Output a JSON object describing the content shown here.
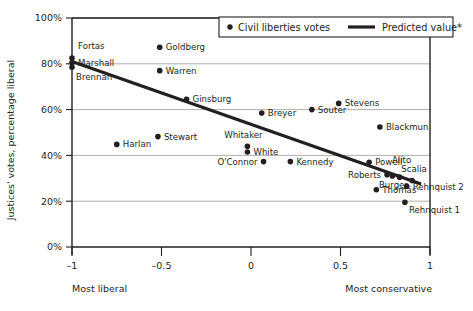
{
  "chart_data": {
    "type": "scatter",
    "title": "",
    "xlabel": "",
    "ylabel": "Justices' votes, percentage liberal",
    "xlim": [
      -1.08,
      1.08
    ],
    "ylim": [
      0,
      100
    ],
    "grid": true,
    "legend_position": "top-right",
    "x_axis_left_note": "Most liberal",
    "x_axis_right_note": "Most conservative",
    "xticks": [
      "–1",
      "–0.5",
      "0",
      "0.5",
      "1"
    ],
    "xtick_values": [
      -1,
      -0.5,
      0,
      0.5,
      1
    ],
    "yticks": [
      "0%",
      "20%",
      "40%",
      "60%",
      "80%",
      "100%"
    ],
    "ytick_values": [
      0,
      20,
      40,
      60,
      80,
      100
    ],
    "series": [
      {
        "name": "Civil liberties votes",
        "type": "scatter",
        "points": [
          {
            "label": "Fortas",
            "x": -1.0,
            "y": 82.5,
            "label_dx": 6,
            "label_dy": -9,
            "anchor": "start"
          },
          {
            "label": "Marshall",
            "x": -1.0,
            "y": 80.5,
            "label_dx": 6,
            "label_dy": 3,
            "anchor": "start"
          },
          {
            "label": "Brennan",
            "x": -1.0,
            "y": 78.5,
            "label_dx": 4,
            "label_dy": 13,
            "anchor": "start"
          },
          {
            "label": "Goldberg",
            "x": -0.51,
            "y": 87.2,
            "label_dx": 6,
            "label_dy": 3,
            "anchor": "start"
          },
          {
            "label": "Warren",
            "x": -0.51,
            "y": 77.0,
            "label_dx": 6,
            "label_dy": 3,
            "anchor": "start"
          },
          {
            "label": "Ginsburg",
            "x": -0.36,
            "y": 64.5,
            "label_dx": 6,
            "label_dy": 3,
            "anchor": "start"
          },
          {
            "label": "Harlan",
            "x": -0.75,
            "y": 44.8,
            "label_dx": 6,
            "label_dy": 3,
            "anchor": "start"
          },
          {
            "label": "Stewart",
            "x": -0.52,
            "y": 48.2,
            "label_dx": 6,
            "label_dy": 3,
            "anchor": "start"
          },
          {
            "label": "Breyer",
            "x": 0.06,
            "y": 58.5,
            "label_dx": 6,
            "label_dy": 3,
            "anchor": "start"
          },
          {
            "label": "Souter",
            "x": 0.34,
            "y": 60.0,
            "label_dx": 6,
            "label_dy": 3,
            "anchor": "start"
          },
          {
            "label": "Stevens",
            "x": 0.49,
            "y": 62.7,
            "label_dx": 6,
            "label_dy": 3,
            "anchor": "start"
          },
          {
            "label": "Blackmun",
            "x": 0.72,
            "y": 52.4,
            "label_dx": 6,
            "label_dy": 3,
            "anchor": "start"
          },
          {
            "label": "Whitaker",
            "x": -0.02,
            "y": 44.0,
            "label_dx": -4,
            "label_dy": -8,
            "anchor": "middle"
          },
          {
            "label": "White",
            "x": -0.02,
            "y": 41.5,
            "label_dx": 6,
            "label_dy": 3,
            "anchor": "start"
          },
          {
            "label": "O'Connor",
            "x": 0.07,
            "y": 37.3,
            "label_dx": -6,
            "label_dy": 3,
            "anchor": "end"
          },
          {
            "label": "Kennedy",
            "x": 0.22,
            "y": 37.3,
            "label_dx": 6,
            "label_dy": 3,
            "anchor": "start"
          },
          {
            "label": "Powell",
            "x": 0.66,
            "y": 37.0,
            "label_dx": 6,
            "label_dy": 3,
            "anchor": "start"
          },
          {
            "label": "Roberts",
            "x": 0.76,
            "y": 31.6,
            "label_dx": -6,
            "label_dy": 3,
            "anchor": "end"
          },
          {
            "label": "Burger",
            "x": 0.79,
            "y": 31.0,
            "label_dx": 1,
            "label_dy": 12,
            "anchor": "middle"
          },
          {
            "label": "Alito",
            "x": 0.83,
            "y": 30.5,
            "label_dx": 2,
            "label_dy": -14,
            "anchor": "middle"
          },
          {
            "label": "Scalia",
            "x": 0.9,
            "y": 29.0,
            "label_dx": 2,
            "label_dy": -9,
            "anchor": "middle"
          },
          {
            "label": "Rehnquist 2",
            "x": 0.87,
            "y": 26.5,
            "label_dx": 6,
            "label_dy": 4,
            "anchor": "start"
          },
          {
            "label": "Thomas",
            "x": 0.7,
            "y": 25.0,
            "label_dx": 6,
            "label_dy": 3,
            "anchor": "start"
          },
          {
            "label": "Rehnquist 1",
            "x": 0.86,
            "y": 19.5,
            "label_dx": 4,
            "label_dy": 11,
            "anchor": "start"
          }
        ]
      },
      {
        "name": "Predicted value*",
        "type": "line",
        "x_start": -1.0,
        "y_start": 81.0,
        "x_end": 0.95,
        "y_end": 27.5
      }
    ]
  },
  "legend": {
    "entry_points_label": "Civil liberties votes",
    "entry_line_label": "Predicted value*"
  },
  "colors": {
    "ink": "#231f20",
    "grid": "#9b9b9b",
    "background": "#ffffff"
  }
}
